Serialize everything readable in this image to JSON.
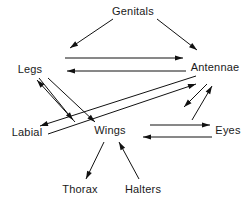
{
  "figure": {
    "kind": "directed-graph",
    "background_color": "#ffffff",
    "line_color": "#111111",
    "text_color": "#1a1a1a",
    "width": 252,
    "height": 207
  },
  "nodes": [
    {
      "id": "genitals",
      "label": "Genitals",
      "x": 133,
      "y": 12
    },
    {
      "id": "legs",
      "label": "Legs",
      "x": 30,
      "y": 70
    },
    {
      "id": "antennae",
      "label": "Antennae",
      "x": 215,
      "y": 68
    },
    {
      "id": "labial",
      "label": "Labial",
      "x": 27,
      "y": 133
    },
    {
      "id": "wings",
      "label": "Wings",
      "x": 110,
      "y": 131
    },
    {
      "id": "eyes",
      "label": "Eyes",
      "x": 228,
      "y": 131
    },
    {
      "id": "thorax",
      "label": "Thorax",
      "x": 80,
      "y": 190
    },
    {
      "id": "halters",
      "label": "Halters",
      "x": 143,
      "y": 190
    }
  ],
  "edges": [
    {
      "id": "genitals-legs",
      "from": "genitals",
      "to": "legs",
      "x1": 113,
      "y1": 19,
      "x2": 70,
      "y2": 48
    },
    {
      "id": "genitals-antennae",
      "from": "genitals",
      "to": "antennae",
      "x1": 157,
      "y1": 19,
      "x2": 197,
      "y2": 50
    },
    {
      "id": "legs-antennae",
      "from": "legs",
      "to": "antennae",
      "x1": 65,
      "y1": 58,
      "x2": 183,
      "y2": 58
    },
    {
      "id": "antennae-legs",
      "from": "antennae",
      "to": "legs",
      "x1": 186,
      "y1": 71,
      "x2": 67,
      "y2": 71
    },
    {
      "id": "legs-wings-a",
      "from": "legs",
      "to": "wings",
      "x1": 39,
      "y1": 78,
      "x2": 73,
      "y2": 120
    },
    {
      "id": "legs-wings-b",
      "from": "legs",
      "to": "wings",
      "x1": 48,
      "y1": 78,
      "x2": 95,
      "y2": 122
    },
    {
      "id": "wings-legs",
      "from": "wings",
      "to": "legs",
      "x1": 75,
      "y1": 122,
      "x2": 37,
      "y2": 80
    },
    {
      "id": "antennae-labial-a",
      "from": "antennae",
      "to": "labial",
      "x1": 196,
      "y1": 76,
      "x2": 40,
      "y2": 126
    },
    {
      "id": "labial-antennae",
      "from": "labial",
      "to": "antennae",
      "x1": 48,
      "y1": 134,
      "x2": 196,
      "y2": 84
    },
    {
      "id": "antennae-eyes",
      "from": "antennae",
      "to": "eyes",
      "x1": 207,
      "y1": 84,
      "x2": 184,
      "y2": 107
    },
    {
      "id": "eyes-antennae",
      "from": "eyes",
      "to": "antennae",
      "x1": 192,
      "y1": 120,
      "x2": 212,
      "y2": 86
    },
    {
      "id": "wings-eyes",
      "from": "wings",
      "to": "eyes",
      "x1": 150,
      "y1": 125,
      "x2": 210,
      "y2": 125
    },
    {
      "id": "eyes-wings",
      "from": "eyes",
      "to": "wings",
      "x1": 212,
      "y1": 137,
      "x2": 143,
      "y2": 137
    },
    {
      "id": "wings-thorax",
      "from": "wings",
      "to": "thorax",
      "x1": 104,
      "y1": 142,
      "x2": 86,
      "y2": 179
    },
    {
      "id": "halters-wings",
      "from": "halters",
      "to": "wings",
      "x1": 139,
      "y1": 179,
      "x2": 119,
      "y2": 142
    }
  ],
  "style": {
    "arrow_length": 8,
    "arrow_half_width": 2.6,
    "label_font_size": 11,
    "line_width": 1
  }
}
